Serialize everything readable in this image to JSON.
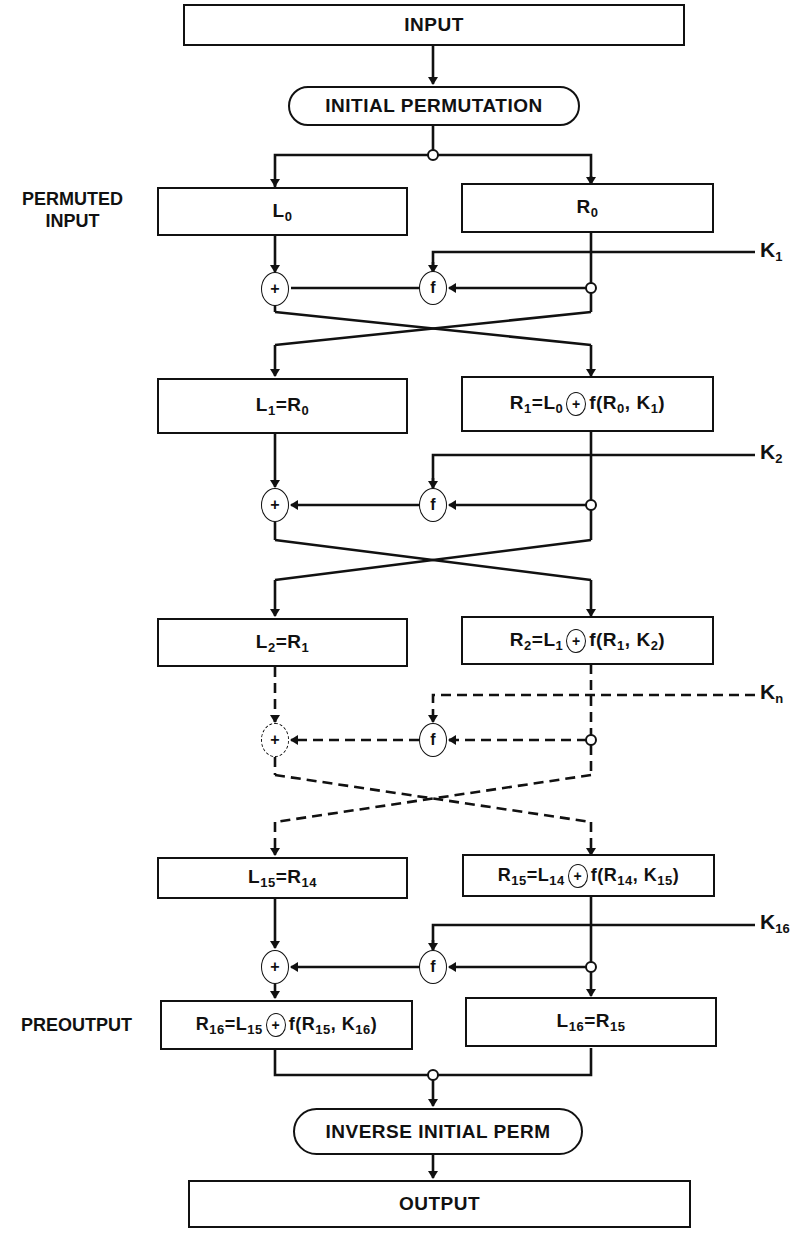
{
  "diagram": {
    "input": "INPUT",
    "initial_permutation": "INITIAL PERMUTATION",
    "permuted_input_label": "PERMUTED INPUT",
    "permuted_input_line1": "PERMUTED",
    "permuted_input_line2": "INPUT",
    "preoutput_label": "PREOUTPUT",
    "inverse_initial_perm": "INVERSE INITIAL PERM",
    "output": "OUTPUT",
    "function_symbol": "f",
    "xor_symbol": "+",
    "keys": [
      {
        "base": "K",
        "sub": "1"
      },
      {
        "base": "K",
        "sub": "2"
      },
      {
        "base": "K",
        "sub": "n"
      },
      {
        "base": "K",
        "sub": "16"
      }
    ],
    "rounds": [
      {
        "left": {
          "text": "L",
          "sub": "0"
        },
        "right": {
          "text": "R",
          "sub": "0"
        }
      },
      {
        "left": "L1=R0",
        "right": "R1=L0 ⊕ f(R0, K1)"
      },
      {
        "left": "L2=R1",
        "right": "R2=L1 ⊕ f(R1, K2)"
      },
      {
        "left": "L15=R14",
        "right": "R15=L14 ⊕ f(R14, K15)"
      },
      {
        "left": "R16=L15 ⊕ f(R15, K16)",
        "right": "L16=R15"
      }
    ],
    "eq": {
      "r1": {
        "a": "R",
        "as": "1",
        "b": "=L",
        "bs": "0",
        "c": "f(R",
        "cs": "0",
        "d": ", K",
        "ds": "1",
        "e": ")"
      },
      "l1": {
        "a": "L",
        "as": "1",
        "b": "=R",
        "bs": "0"
      },
      "r2": {
        "a": "R",
        "as": "2",
        "b": "=L",
        "bs": "1",
        "c": "f(R",
        "cs": "1",
        "d": ", K",
        "ds": "2",
        "e": ")"
      },
      "l2": {
        "a": "L",
        "as": "2",
        "b": "=R",
        "bs": "1"
      },
      "r15": {
        "a": "R",
        "as": "15",
        "b": "=L",
        "bs": "14",
        "c": "f(R",
        "cs": "14",
        "d": ", K",
        "ds": "15",
        "e": ")"
      },
      "l15": {
        "a": "L",
        "as": "15",
        "b": "=R",
        "bs": "14"
      },
      "r16": {
        "a": "R",
        "as": "16",
        "b": "=L",
        "bs": "15",
        "c": "f(R",
        "cs": "15",
        "d": ", K",
        "ds": "16",
        "e": ")"
      },
      "l16": {
        "a": "L",
        "as": "16",
        "b": "=R",
        "bs": "15"
      }
    },
    "colors": {
      "line": "#111111",
      "background": "#ffffff"
    }
  }
}
